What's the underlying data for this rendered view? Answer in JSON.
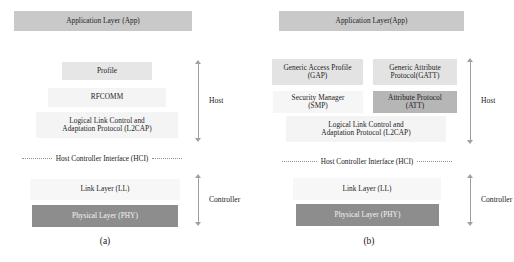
{
  "figure": {
    "panels": [
      {
        "caption": "(a)",
        "layers": [
          {
            "name": "application-layer",
            "label": "Application Layer (App)",
            "shade": "#c9c9c9"
          },
          {
            "name": "profile",
            "label": "Profile",
            "shade": "#e6e6e6"
          },
          {
            "name": "rfcomm",
            "label": "RFCOMM",
            "shade": "#f4f4f4"
          },
          {
            "name": "l2cap",
            "label_line1": "Logical Link Control and",
            "label_line2": "Adaptation Protocol (L2CAP)",
            "shade": "#f4f4f4"
          },
          {
            "name": "link-layer",
            "label": "Link Layer (LL)",
            "shade": "#f7f7f7"
          },
          {
            "name": "physical-layer",
            "label": "Physical Layer (PHY)",
            "shade": "#8d8d8d"
          }
        ],
        "interface_divider": "Host Controller Interface (HCI)",
        "brackets": [
          {
            "name": "host",
            "label": "Host"
          },
          {
            "name": "controller",
            "label": "Controller"
          }
        ]
      },
      {
        "caption": "(b)",
        "layers": [
          {
            "name": "application-layer",
            "label": "Application Layer(App)",
            "shade": "#c9c9c9"
          },
          {
            "name": "gap",
            "label_line1": "Generic Access Profile",
            "label_line2": "(GAP)",
            "shade": "#e3e3e3"
          },
          {
            "name": "gatt",
            "label_line1": "Generic Attribute",
            "label_line2": "Protocol(GATT)",
            "shade": "#e3e3e3"
          },
          {
            "name": "smp",
            "label_line1": "Security Manager",
            "label_line2": "(SMP)",
            "shade": "#f4f4f4"
          },
          {
            "name": "att",
            "label_line1": "Attribute Protocol",
            "label_line2": "(ATT)",
            "shade": "#b6b6b6"
          },
          {
            "name": "l2cap",
            "label_line1": "Logical Link Control and",
            "label_line2": "Adaptation Protocol (L2CAP)",
            "shade": "#f4f4f4"
          },
          {
            "name": "link-layer",
            "label": "Link Layer (LL)",
            "shade": "#f7f7f7"
          },
          {
            "name": "physical-layer",
            "label": "Physical Layer (PHY)",
            "shade": "#8d8d8d"
          }
        ],
        "interface_divider": "Host Controller Interface (HCI)",
        "brackets": [
          {
            "name": "host",
            "label": "Host"
          },
          {
            "name": "controller",
            "label": "Controller"
          }
        ]
      }
    ]
  }
}
